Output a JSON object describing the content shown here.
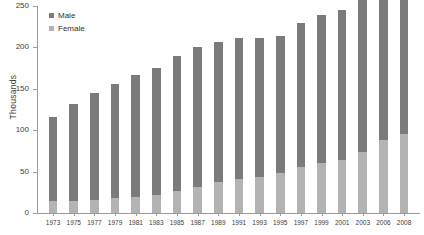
{
  "chart_data": {
    "type": "bar",
    "stacked": true,
    "title": "",
    "subtitle": "",
    "xlabel": "",
    "ylabel": "Thousands",
    "ylim": [
      0,
      250
    ],
    "ytick_values": [
      0,
      50,
      100,
      150,
      200,
      250
    ],
    "ytick_labels": [
      "0",
      "50",
      "100",
      "150",
      "200",
      "250"
    ],
    "grid": false,
    "legend_position": "top-left",
    "categories": [
      "1973",
      "1975",
      "1977",
      "1979",
      "1981",
      "1983",
      "1985",
      "1987",
      "1989",
      "1991",
      "1993",
      "1995",
      "1997",
      "1999",
      "2001",
      "2003",
      "2006",
      "2008"
    ],
    "series": [
      {
        "name": "Female",
        "color": "#b3b3b3",
        "values": [
          14,
          15,
          16,
          18,
          19,
          22,
          27,
          31,
          38,
          41,
          44,
          48,
          55,
          60,
          64,
          74,
          88,
          95
        ]
      },
      {
        "name": "Male",
        "color": "#7b7b7b",
        "values": [
          102,
          117,
          129,
          138,
          148,
          153,
          163,
          169,
          169,
          170,
          167,
          166,
          175,
          179,
          181,
          183,
          182,
          173
        ]
      }
    ],
    "totals": [
      116,
      132,
      145,
      156,
      167,
      175,
      190,
      200,
      207,
      211,
      211,
      214,
      230,
      239,
      245,
      257,
      270,
      268
    ]
  },
  "legend": {
    "items": [
      {
        "label": "Male",
        "color": "#7b7b7b"
      },
      {
        "label": "Female",
        "color": "#b3b3b3"
      }
    ]
  },
  "axis": {
    "y_title": "Thousands"
  }
}
